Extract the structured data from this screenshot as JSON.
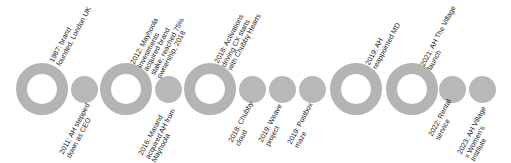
{
  "timeline": {
    "colors": {
      "marker_fill": "#b8b8b8",
      "ring_stroke": "#b4b4b4",
      "text": "#222222",
      "background": "#ffffff"
    },
    "events": [
      {
        "type": "major",
        "position": "above",
        "lines": [
          "1987: brand",
          "founded, London UK"
        ]
      },
      {
        "type": "minor",
        "position": "below",
        "lines": [
          "2011: AH stepped",
          "down as CEO"
        ]
      },
      {
        "type": "major",
        "position": "above",
        "lines": [
          "2012: Mayhoola",
          "Investments",
          "acquired brand",
          "stake; reached 75%",
          "ownership, 2018"
        ]
      },
      {
        "type": "minor",
        "position": "below",
        "lines": [
          "2016: Marand",
          "acquired AH from",
          "Mayhoola"
        ]
      },
      {
        "type": "major",
        "position": "above",
        "lines": [
          "2018: Activations",
          "driving CX starts",
          "with Chubby Hearts"
        ]
      },
      {
        "type": "minor",
        "position": "below",
        "lines": [
          "2018: Chubby",
          "cloud"
        ]
      },
      {
        "type": "minor",
        "position": "below",
        "lines": [
          "2019: Weave",
          "project"
        ]
      },
      {
        "type": "minor",
        "position": "below",
        "lines": [
          "2019: Postbox",
          "maze"
        ]
      },
      {
        "type": "major",
        "position": "above",
        "lines": [
          "2019: AH",
          "reappointed MD"
        ]
      },
      {
        "type": "major",
        "position": "above",
        "lines": [
          "2021: AH The Village",
          "launch"
        ]
      },
      {
        "type": "minor",
        "position": "below",
        "lines": [
          "2022: Rental",
          "service"
        ]
      },
      {
        "type": "minor",
        "position": "below",
        "lines": [
          "2023: AH Village",
          "x Women's",
          "Institute"
        ]
      }
    ]
  }
}
